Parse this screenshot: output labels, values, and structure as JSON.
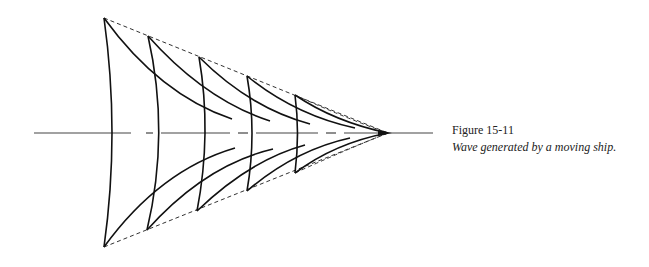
{
  "figure": {
    "number": "Figure 15-11",
    "caption": "Wave generated by a moving ship."
  },
  "diagram": {
    "colors": {
      "stroke": "#111111",
      "dashed": "#333333",
      "axis": "#444444",
      "background": "#ffffff"
    },
    "apex": [
      388,
      133
    ],
    "axis": {
      "y": 133,
      "x_start": 34,
      "x_end": 433
    },
    "top_tips": [
      [
        104,
        18
      ],
      [
        148,
        36
      ],
      [
        199,
        57
      ],
      [
        247,
        76
      ],
      [
        295,
        95
      ]
    ],
    "bottom_tips": [
      [
        104,
        247
      ],
      [
        147,
        230
      ],
      [
        197,
        211
      ],
      [
        247,
        191
      ],
      [
        295,
        173
      ]
    ],
    "crest_axis_x": [
      114,
      163,
      207,
      253,
      298
    ]
  }
}
